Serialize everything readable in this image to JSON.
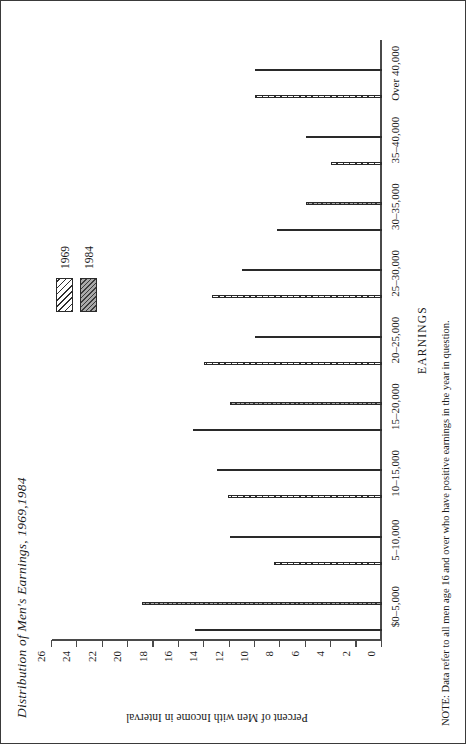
{
  "figure": {
    "title": "Distribution of Men's Earnings, 1969,1984",
    "note_lead": "NOTE:",
    "note_text": "Data refer to all men age 16 and over who have positive earnings in the year in question."
  },
  "legend": {
    "items": [
      {
        "label": "1969",
        "pattern": "diagonal-hatch-white",
        "color": "#ffffff"
      },
      {
        "label": "1984",
        "pattern": "diagonal-hatch-gray",
        "color": "#8d8d8d"
      }
    ]
  },
  "chart_data": {
    "type": "bar",
    "title": "Distribution of Men's Earnings, 1969,1984",
    "xlabel": "EARNINGS",
    "ylabel": "Percent of Men with Income in Interval",
    "categories": [
      "$0–5,000",
      "5–10,000",
      "10–15,000",
      "15–20,000",
      "20–25,000",
      "25–30,000",
      "30–35,000",
      "35–40,000",
      "Over 40,000"
    ],
    "series": [
      {
        "name": "1969",
        "values": [
          14.7,
          8.5,
          12.1,
          14.9,
          14.0,
          13.4,
          8.3,
          4.0,
          10.0
        ]
      },
      {
        "name": "1984",
        "values": [
          18.9,
          12.0,
          13.0,
          12.0,
          10.0,
          11.0,
          6.0,
          6.0,
          10.0
        ]
      }
    ],
    "ylim": [
      0,
      26
    ],
    "yticks": [
      0,
      2,
      4,
      6,
      8,
      10,
      12,
      14,
      16,
      18,
      20,
      22,
      24,
      26
    ],
    "ytick_labels": [
      "0",
      "2",
      "4",
      "6",
      "8",
      "10",
      "12",
      "14",
      "16",
      "18",
      "20",
      "22",
      "24",
      "26"
    ],
    "grid": false,
    "legend_position": "top-right",
    "orientation": "vertical-bars"
  }
}
